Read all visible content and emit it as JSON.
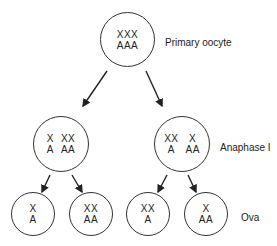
{
  "stages": {
    "primary": {
      "label": "Primary oocyte"
    },
    "anaphase": {
      "label": "Anaphase I"
    },
    "ova": {
      "label": "Ova"
    }
  },
  "cells": {
    "primary": {
      "groups": [
        {
          "x": "XXX",
          "a": "AAA"
        }
      ]
    },
    "anaphase_left": {
      "groups": [
        {
          "x": "X",
          "a": "A"
        },
        {
          "x": "XX",
          "a": "AA"
        }
      ]
    },
    "anaphase_right": {
      "groups": [
        {
          "x": "XX",
          "a": "A"
        },
        {
          "x": "X",
          "a": "AA"
        }
      ]
    },
    "ovum_1": {
      "groups": [
        {
          "x": "X",
          "a": "A"
        }
      ]
    },
    "ovum_2": {
      "groups": [
        {
          "x": "XX",
          "a": "AA"
        }
      ]
    },
    "ovum_3": {
      "groups": [
        {
          "x": "XX",
          "a": "A"
        }
      ]
    },
    "ovum_4": {
      "groups": [
        {
          "x": "X",
          "a": "AA"
        }
      ]
    }
  }
}
